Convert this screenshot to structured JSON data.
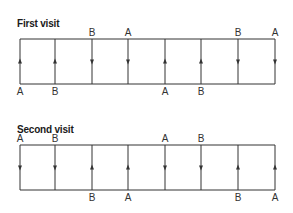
{
  "panels": [
    {
      "title": "First visit",
      "top": 39,
      "bottom": 84,
      "columns": [
        {
          "x": 20,
          "direction": "up",
          "top_label": "",
          "bottom_label": "A"
        },
        {
          "x": 55,
          "direction": "up",
          "top_label": "",
          "bottom_label": "B"
        },
        {
          "x": 92,
          "direction": "down",
          "top_label": "B",
          "bottom_label": ""
        },
        {
          "x": 128,
          "direction": "down",
          "top_label": "A",
          "bottom_label": ""
        },
        {
          "x": 165,
          "direction": "up",
          "top_label": "",
          "bottom_label": "A"
        },
        {
          "x": 201,
          "direction": "up",
          "top_label": "",
          "bottom_label": "B"
        },
        {
          "x": 238,
          "direction": "down",
          "top_label": "B",
          "bottom_label": ""
        },
        {
          "x": 275,
          "direction": "down",
          "top_label": "A",
          "bottom_label": ""
        }
      ]
    },
    {
      "title": "Second visit",
      "top": 145,
      "bottom": 190,
      "columns": [
        {
          "x": 20,
          "direction": "down",
          "top_label": "A",
          "bottom_label": ""
        },
        {
          "x": 55,
          "direction": "down",
          "top_label": "B",
          "bottom_label": ""
        },
        {
          "x": 92,
          "direction": "up",
          "top_label": "",
          "bottom_label": "B"
        },
        {
          "x": 128,
          "direction": "up",
          "top_label": "",
          "bottom_label": "A"
        },
        {
          "x": 165,
          "direction": "down",
          "top_label": "A",
          "bottom_label": ""
        },
        {
          "x": 201,
          "direction": "down",
          "top_label": "B",
          "bottom_label": ""
        },
        {
          "x": 238,
          "direction": "up",
          "top_label": "",
          "bottom_label": "B"
        },
        {
          "x": 275,
          "direction": "up",
          "top_label": "",
          "bottom_label": "A"
        }
      ]
    }
  ],
  "colors": {
    "line": "#333333",
    "text": "#1a1a1a"
  }
}
